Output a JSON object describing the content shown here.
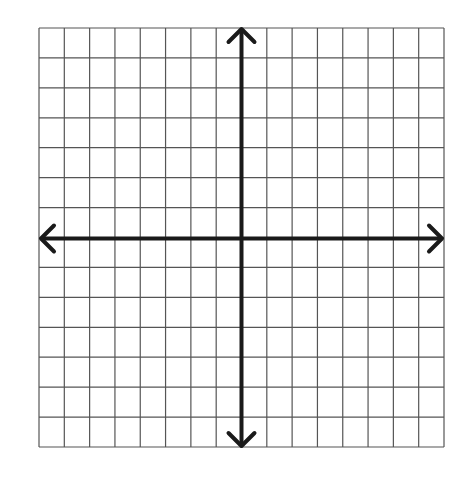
{
  "diagram": {
    "type": "coordinate-plane",
    "grid": {
      "columns": 16,
      "rows": 14,
      "left": 39,
      "top": 28,
      "right": 444,
      "bottom": 447,
      "line_color": "#555555"
    },
    "axes": {
      "x_axis_row_index": 7,
      "y_axis_col_index": 8,
      "color": "#1a1a1a",
      "arrows": [
        "left",
        "right",
        "up",
        "down"
      ]
    },
    "labels": []
  }
}
